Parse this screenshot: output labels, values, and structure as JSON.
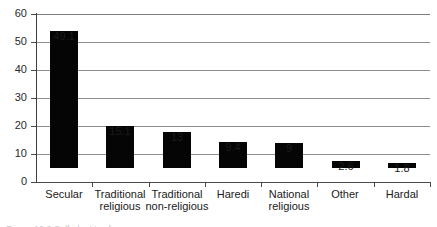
{
  "chart_data": {
    "type": "bar",
    "title": "",
    "xlabel": "",
    "ylabel": "",
    "ylim": [
      0,
      60
    ],
    "ytick_step": 10,
    "yticks": [
      "0",
      "10",
      "20",
      "30",
      "40",
      "50",
      "60"
    ],
    "grid": "horizontal",
    "legend": "none",
    "categories": [
      "Secular",
      "Traditional religious",
      "Traditional non-religious",
      "Haredi",
      "National religious",
      "Other",
      "Hardal"
    ],
    "category_lines": [
      {
        "line1": "Secular",
        "line2": ""
      },
      {
        "line1": "Traditional",
        "line2": "religious"
      },
      {
        "line1": "Traditional",
        "line2": "non-religious"
      },
      {
        "line1": "Haredi",
        "line2": ""
      },
      {
        "line1": "National",
        "line2": "religious"
      },
      {
        "line1": "Other",
        "line2": ""
      },
      {
        "line1": "Hardal",
        "line2": ""
      }
    ],
    "values": [
      49.1,
      15.1,
      13,
      9.4,
      9,
      2.6,
      1.8
    ],
    "value_labels": [
      "49.1",
      "15.1",
      "13",
      "9.4",
      "9",
      "2.6",
      "1.8"
    ],
    "bar_color": "#050505",
    "gridline_color": "#8e8e8e",
    "axis_color": "#4a4a4a"
  },
  "caption": {
    "cut_off_text": "Figure   10.2  Self-identity of"
  }
}
